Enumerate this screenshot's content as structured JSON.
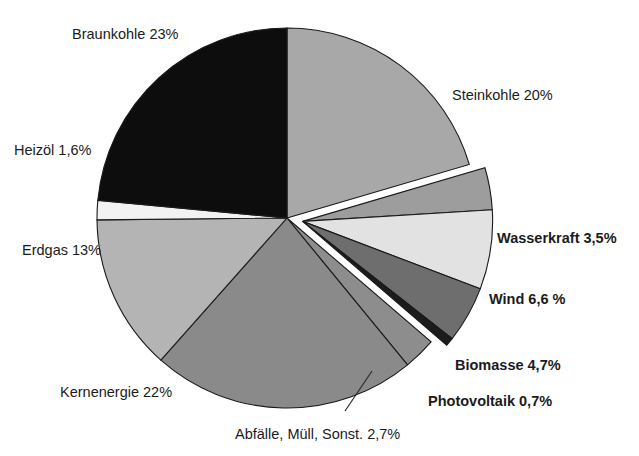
{
  "chart_data": {
    "type": "pie",
    "title": "",
    "subtitle": "",
    "xlabel": "",
    "ylabel": "",
    "legend_position": "none",
    "grid": false,
    "value_unit": "%",
    "decimal_separator": ",",
    "categories": [
      "Steinkohle",
      "Wasserkraft",
      "Wind",
      "Biomasse",
      "Photovoltaik",
      "Abfälle, Müll, Sonst.",
      "Kernenergie",
      "Erdgas",
      "Heizöl",
      "Braunkohle"
    ],
    "values": [
      20,
      3.5,
      6.6,
      4.7,
      0.7,
      2.7,
      22,
      13,
      1.6,
      23
    ],
    "slices": [
      {
        "key": "steinkohle",
        "label": "Steinkohle 20%",
        "name": "Steinkohle",
        "value": 20,
        "color": "#a8a8a8",
        "exploded": false,
        "bold": false
      },
      {
        "key": "wasserkraft",
        "label": "Wasserkraft 3,5%",
        "name": "Wasserkraft",
        "value": 3.5,
        "color": "#9d9d9d",
        "exploded": true,
        "bold": true
      },
      {
        "key": "wind",
        "label": "Wind 6,6 %",
        "name": "Wind",
        "value": 6.6,
        "color": "#e2e2e2",
        "exploded": true,
        "bold": true
      },
      {
        "key": "biomasse",
        "label": "Biomasse 4,7%",
        "name": "Biomasse",
        "value": 4.7,
        "color": "#6e6e6e",
        "exploded": true,
        "bold": true
      },
      {
        "key": "photovoltaik",
        "label": "Photovoltaik 0,7%",
        "name": "Photovoltaik",
        "value": 0.7,
        "color": "#1c1c1c",
        "exploded": true,
        "bold": true
      },
      {
        "key": "abfaelle",
        "label": "Abfälle, Müll, Sonst. 2,7%",
        "name": "Abfälle, Müll, Sonst.",
        "value": 2.7,
        "color": "#8d8d8d",
        "exploded": false,
        "bold": false
      },
      {
        "key": "kernenergie",
        "label": "Kernenergie 22%",
        "name": "Kernenergie",
        "value": 22,
        "color": "#8a8a8a",
        "exploded": false,
        "bold": false
      },
      {
        "key": "erdgas",
        "label": "Erdgas 13%",
        "name": "Erdgas",
        "value": 13,
        "color": "#b4b4b4",
        "exploded": false,
        "bold": false
      },
      {
        "key": "heizoel",
        "label": "Heizöl 1,6%",
        "name": "Heizöl",
        "value": 1.6,
        "color": "#f2f2f2",
        "exploded": false,
        "bold": false
      },
      {
        "key": "braunkohle",
        "label": "Braunkohle 23%",
        "name": "Braunkohle",
        "value": 23,
        "color": "#0d0d0d",
        "exploded": false,
        "bold": false
      }
    ],
    "colors": {
      "braunkohle": "#0d0d0d",
      "steinkohle": "#a8a8a8",
      "wasserkraft": "#9d9d9d",
      "wind": "#e2e2e2",
      "biomasse": "#6e6e6e",
      "photovoltaik": "#1c1c1c",
      "abfaelle": "#8d8d8d",
      "kernenergie": "#8a8a8a",
      "erdgas": "#b4b4b4",
      "heizoel": "#f2f2f2",
      "outline": "#1a1a1a",
      "background": "#ffffff",
      "text": "#1b1b1b"
    }
  },
  "labels": {
    "braunkohle": "Braunkohle 23%",
    "steinkohle": "Steinkohle 20%",
    "heizoel": "Heizöl 1,6%",
    "erdgas": "Erdgas 13%",
    "kernenergie": "Kernenergie 22%",
    "abfaelle": "Abfälle, Müll, Sonst. 2,7%",
    "wasserkraft": "Wasserkraft 3,5%",
    "wind": "Wind 6,6 %",
    "biomasse": "Biomasse 4,7%",
    "photovoltaik": "Photovoltaik 0,7%"
  }
}
